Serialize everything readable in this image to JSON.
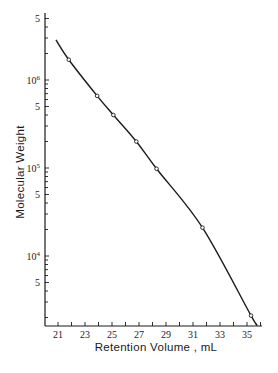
{
  "chart_data": {
    "type": "line",
    "title": "",
    "xlabel": "Retention Volume , mL",
    "ylabel": "Molecular Weight",
    "yscale": "log",
    "xlim": [
      20.2,
      36.5
    ],
    "ylim": [
      1600,
      7000000
    ],
    "grid": false,
    "legend": null,
    "x_ticks": [
      21,
      23,
      25,
      27,
      29,
      31,
      33,
      35
    ],
    "x_tick_labels": [
      "21",
      "23",
      "25",
      "27",
      "29",
      "31",
      "33",
      "35"
    ],
    "y_tick_labels": [
      {
        "value": 5000000,
        "label": "5",
        "sup": ""
      },
      {
        "value": 1000000,
        "label": "10",
        "sup": "6"
      },
      {
        "value": 500000,
        "label": "5",
        "sup": ""
      },
      {
        "value": 100000,
        "label": "10",
        "sup": "5"
      },
      {
        "value": 50000,
        "label": "5",
        "sup": ""
      },
      {
        "value": 10000,
        "label": "10",
        "sup": "4"
      },
      {
        "value": 5000,
        "label": "5",
        "sup": ""
      }
    ],
    "series": [
      {
        "name": "calibration-curve",
        "style": "smooth line",
        "x": [
          20.85,
          21.8,
          23.9,
          25.1,
          26.8,
          28.3,
          31.7,
          35.3,
          35.7
        ],
        "y": [
          2850000,
          1700000,
          660000,
          400000,
          200000,
          98000,
          21000,
          2100,
          1700
        ]
      },
      {
        "name": "standards",
        "style": "open circle markers",
        "x": [
          21.8,
          23.9,
          25.1,
          26.8,
          28.3,
          31.7,
          35.3
        ],
        "y": [
          1700000,
          660000,
          400000,
          200000,
          98000,
          21000,
          2100
        ]
      }
    ]
  },
  "colors": {
    "ink": "#1a1a1a",
    "background": "#ffffff"
  }
}
